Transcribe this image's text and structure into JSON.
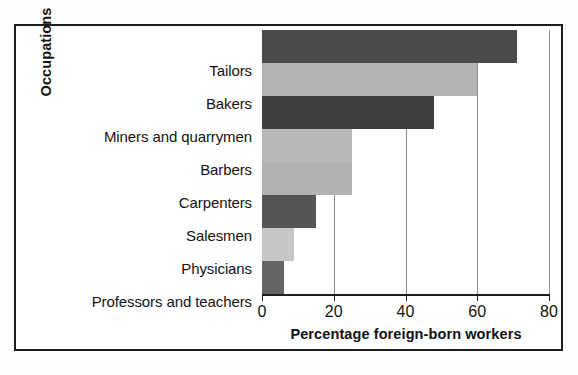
{
  "figure": {
    "cropped_title_fragment": "",
    "frame_color": "#1d1d1d",
    "background": "#ffffff"
  },
  "chart_data": {
    "type": "bar",
    "orientation": "horizontal",
    "title": "",
    "xlabel": "Percentage foreign-born workers",
    "ylabel": "Occupations",
    "categories": [
      "Tailors",
      "Bakers",
      "Miners and quarrymen",
      "Barbers",
      "Carpenters",
      "Salesmen",
      "Physicians",
      "Professors and teachers"
    ],
    "values": [
      71,
      60,
      48,
      25,
      25,
      15,
      9,
      6
    ],
    "bar_colors": [
      "#4a4a4a",
      "#b4b4b4",
      "#3f3f3f",
      "#b9b9b9",
      "#b1b1b1",
      "#555555",
      "#c6c6c6",
      "#666666"
    ],
    "xlim": [
      0,
      80
    ],
    "xticks": [
      0,
      20,
      40,
      60,
      80
    ],
    "xticklabels": [
      "0",
      "20",
      "40",
      "60",
      "80"
    ],
    "grid": "vertical",
    "gridlines_at": [
      20,
      40,
      60,
      80
    ],
    "gridline_color": "#8e8e8e",
    "legend": null
  }
}
